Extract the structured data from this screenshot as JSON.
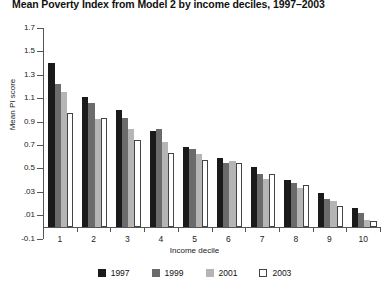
{
  "chart_data": {
    "type": "bar",
    "title": "Mean Poverty Index from Model 2 by income deciles, 1997–2003",
    "xlabel": "Income decile",
    "ylabel": "Mean PI score",
    "categories": [
      "1",
      "2",
      "3",
      "4",
      "5",
      "6",
      "7",
      "8",
      "9",
      "10"
    ],
    "ytick_labels": [
      "1.7",
      "1.5",
      "1.3",
      "1.1",
      "0.9",
      "0.7",
      "0.5",
      ".03",
      ".01",
      "-0.1"
    ],
    "ytick_values": [
      1.7,
      1.5,
      1.3,
      1.1,
      0.9,
      0.7,
      0.5,
      0.3,
      0.1,
      -0.1
    ],
    "ylim": [
      -0.1,
      1.7
    ],
    "grid": false,
    "legend_position": "bottom",
    "series": [
      {
        "name": "1997",
        "color": "#1a1a1a",
        "values": [
          1.4,
          1.11,
          1.0,
          0.82,
          0.68,
          0.59,
          0.51,
          0.4,
          0.29,
          0.16
        ]
      },
      {
        "name": "1999",
        "color": "#6b6b6b",
        "values": [
          1.22,
          1.06,
          0.93,
          0.84,
          0.67,
          0.55,
          0.45,
          0.38,
          0.24,
          0.12
        ]
      },
      {
        "name": "2001",
        "color": "#b5b5b5",
        "values": [
          1.15,
          0.92,
          0.84,
          0.73,
          0.62,
          0.56,
          0.41,
          0.33,
          0.22,
          0.06
        ]
      },
      {
        "name": "2003",
        "color": "#ffffff",
        "values": [
          0.97,
          0.93,
          0.74,
          0.63,
          0.57,
          0.55,
          0.45,
          0.36,
          0.18,
          0.05
        ]
      }
    ]
  }
}
